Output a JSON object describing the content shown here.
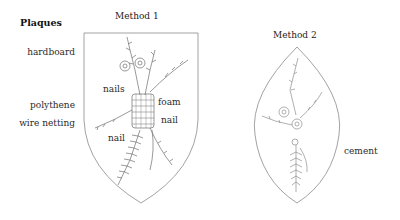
{
  "title": "Plaques",
  "methods": [
    {
      "heading": "Method 1",
      "shape": "shield",
      "side_labels": [
        "hardboard",
        "polythene",
        "wire netting"
      ],
      "inner_labels": [
        "nails",
        "foam",
        "nail",
        "nail"
      ]
    },
    {
      "heading": "Method 2",
      "shape": "pointed-oval",
      "side_labels": [
        "cement"
      ]
    }
  ],
  "colors": {
    "outline": "#8a8a8a",
    "drawing": "#6e6e6e",
    "text": "#222222"
  }
}
